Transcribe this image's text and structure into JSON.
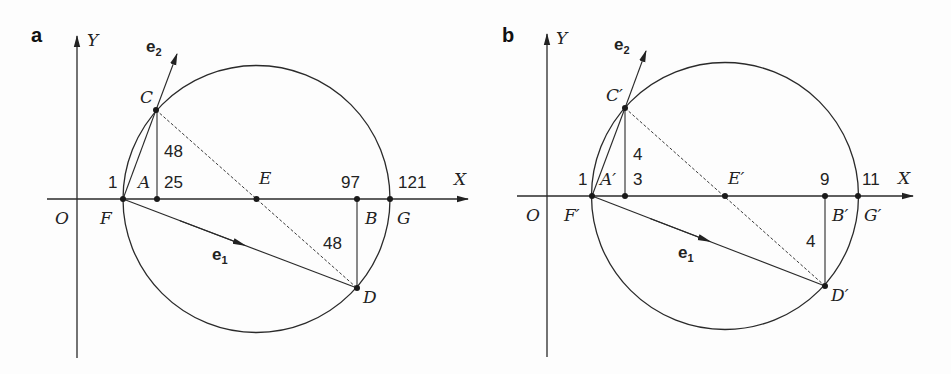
{
  "figure": {
    "panels": [
      {
        "id": "a",
        "label": "a",
        "axis_labels": {
          "x": "X",
          "y": "Y",
          "origin": "O"
        },
        "points": {
          "F": {
            "label": "F",
            "value": "1"
          },
          "A": {
            "label": "A",
            "value": "25"
          },
          "E": {
            "label": "E"
          },
          "B": {
            "label": "B",
            "value": "97"
          },
          "G": {
            "label": "G",
            "value": "121"
          },
          "C": {
            "label": "C"
          },
          "D": {
            "label": "D"
          }
        },
        "segment_labels": {
          "AC": "48",
          "BD": "48"
        },
        "vectors": {
          "e1": {
            "base": "e",
            "sub": "1"
          },
          "e2": {
            "base": "e",
            "sub": "2"
          }
        }
      },
      {
        "id": "b",
        "label": "b",
        "axis_labels": {
          "x": "X",
          "y": "Y",
          "origin": "O"
        },
        "points": {
          "F": {
            "label": "F′",
            "value": "1"
          },
          "A": {
            "label": "A′",
            "value": "3"
          },
          "E": {
            "label": "E′"
          },
          "B": {
            "label": "B′",
            "value": "9"
          },
          "G": {
            "label": "G′",
            "value": "11"
          },
          "C": {
            "label": "C′"
          },
          "D": {
            "label": "D′"
          }
        },
        "segment_labels": {
          "AC": "4",
          "BD": "4"
        },
        "vectors": {
          "e1": {
            "base": "e",
            "sub": "1"
          },
          "e2": {
            "base": "e",
            "sub": "2"
          }
        }
      }
    ]
  }
}
